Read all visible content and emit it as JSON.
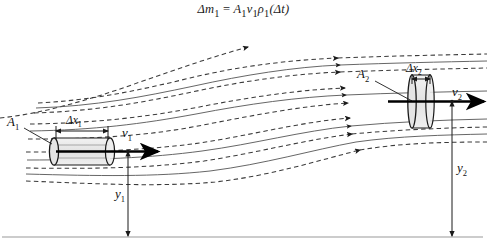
{
  "figure": {
    "equation": "Δm₁ = A₁v₁ρ₁(Δt)",
    "equation_parts": {
      "delta_m": "Δm",
      "m_sub": "1",
      "equals": "=",
      "area": "A",
      "area_sub": "1",
      "velocity": "v",
      "velocity_sub": "1",
      "density": "ρ",
      "density_sub": "1",
      "delta_t": "(Δt)"
    },
    "labels": {
      "area_1": "A",
      "area_1_sub": "1",
      "area_2": "A",
      "area_2_sub": "2",
      "velocity_1": "v",
      "velocity_1_sub": "1",
      "velocity_2": "v",
      "velocity_2_sub": "2",
      "delta_x_1": "Δx",
      "delta_x_1_sub": "1",
      "delta_x_2": "Δx",
      "delta_x_2_sub": "2",
      "height_1": "y",
      "height_1_sub": "1",
      "height_2": "y",
      "height_2_sub": "2"
    },
    "colors": {
      "ink": "#1a1a1a",
      "streamline": "#3a3a3a",
      "baseline": "#9a9a9a",
      "tube_fill": "#e8e8e8",
      "dimension": "#2b2b2b"
    },
    "elements": {
      "baseline_name": "ground-reference-line",
      "tube_1_name": "fluid-element-left",
      "tube_2_name": "fluid-element-right",
      "streamline_count": 8
    }
  }
}
